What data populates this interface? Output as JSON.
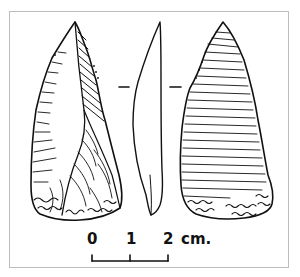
{
  "figure": {
    "type": "archaeological line drawing",
    "views": [
      {
        "id": "face-a",
        "label": "dorsal face"
      },
      {
        "id": "profile",
        "label": "side profile"
      },
      {
        "id": "face-b",
        "label": "ventral face"
      }
    ],
    "section_marks": true
  },
  "scale_bar": {
    "ticks": [
      "0",
      "1",
      "2"
    ],
    "unit": "cm."
  },
  "colors": {
    "ink": "#111111",
    "frame": "#bdbdbd",
    "background": "#ffffff"
  }
}
